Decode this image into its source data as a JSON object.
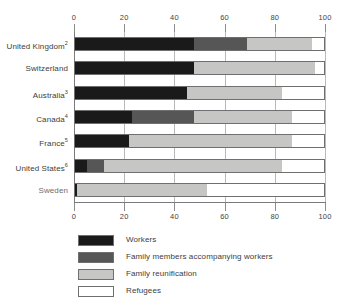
{
  "chart_data": {
    "type": "bar",
    "orientation": "horizontal",
    "stacked": true,
    "stack_total": 100,
    "title": "",
    "xlabel": "",
    "ylabel": "",
    "xlim": [
      0,
      100
    ],
    "xticks": [
      0,
      20,
      40,
      60,
      80,
      100
    ],
    "xtick_labels": [
      "0",
      "20",
      "40",
      "60",
      "80",
      "100"
    ],
    "axis_top_labels": [
      "0",
      "20",
      "40",
      "60",
      "80",
      "100"
    ],
    "axis_bottom_labels": [
      "0",
      "20",
      "40",
      "60",
      "80",
      "100"
    ],
    "grid": true,
    "grid_axis": "x",
    "legend_position": "bottom-left",
    "categories": [
      "United Kingdom",
      "Switzerland",
      "Australia",
      "Canada",
      "France",
      "United States",
      "Sweden"
    ],
    "category_footnotes": [
      "2",
      "",
      "3",
      "4",
      "5",
      "6",
      ""
    ],
    "category_labels": [
      "United Kingdom",
      "Switzerland",
      "Australia",
      "Canada",
      "France",
      "United States",
      "Sweden"
    ],
    "series": [
      {
        "name": "Workers",
        "color": "#1a1a1a",
        "values": [
          48,
          48,
          45,
          23,
          22,
          5,
          1
        ]
      },
      {
        "name": "Family members accompanying workers",
        "color": "#565656",
        "values": [
          21,
          0,
          0,
          25,
          0,
          7,
          0
        ]
      },
      {
        "name": "Family reunification",
        "color": "#c6c6c4",
        "values": [
          26,
          48,
          38,
          39,
          65,
          71,
          52
        ]
      },
      {
        "name": "Refugees",
        "color": "#ffffff",
        "values": [
          5,
          4,
          17,
          13,
          13,
          17,
          47
        ]
      }
    ]
  },
  "legend": {
    "items": [
      {
        "label": "Workers",
        "color": "#1a1a1a"
      },
      {
        "label": "Family members accompanying workers",
        "color": "#565656"
      },
      {
        "label": "Family reunification",
        "color": "#c6c6c4"
      },
      {
        "label": "Refugees",
        "color": "#ffffff"
      }
    ]
  }
}
